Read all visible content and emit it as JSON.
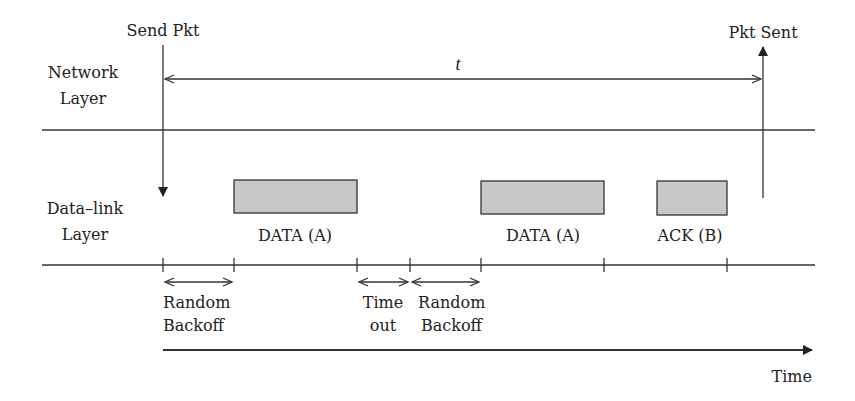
{
  "labels": {
    "send_pkt": "Send Pkt",
    "pkt_sent": "Pkt Sent",
    "network_layer_line1": "Network",
    "network_layer_line2": "Layer",
    "datalink_layer_line1": "Data–link",
    "datalink_layer_line2": "Layer",
    "duration": "t",
    "time_axis": "Time"
  },
  "frames": [
    {
      "label": "DATA (A)",
      "fill": "#c8c8c8"
    },
    {
      "label": "DATA (A)",
      "fill": "#c8c8c8"
    },
    {
      "label": "ACK (B)",
      "fill": "#c8c8c8"
    }
  ],
  "intervals": [
    {
      "line1": "Random",
      "line2": "Backoff"
    },
    {
      "line1": "Time",
      "line2": "out"
    },
    {
      "line1": "Random",
      "line2": "Backoff"
    }
  ],
  "colors": {
    "line": "#333333",
    "frame_fill": "#c8c8c8",
    "background": "#ffffff"
  }
}
